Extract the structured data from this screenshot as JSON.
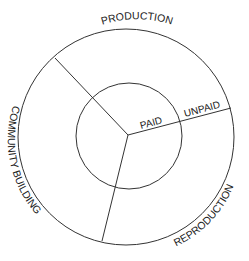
{
  "diagram": {
    "outer_ring_labels": {
      "top": "PRODUCTION",
      "left": "COMMUNITY BUILDING",
      "bottom_right": "REPRODUCTION"
    },
    "inner_labels": {
      "paid": "PAID",
      "unpaid": "UNPAID"
    },
    "colors": {
      "stroke": "#333333",
      "text": "#222222",
      "background": "#ffffff"
    }
  }
}
